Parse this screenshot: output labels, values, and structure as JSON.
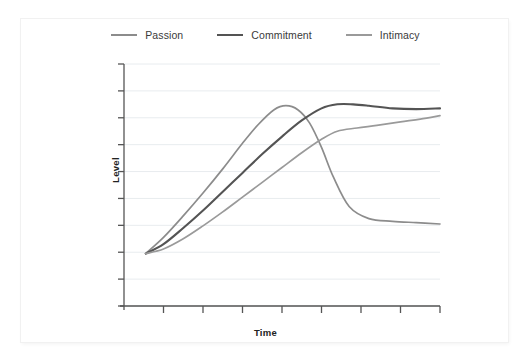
{
  "chart_data": {
    "type": "line",
    "title": "",
    "xlabel": "Time",
    "ylabel": "Level",
    "grid": true,
    "legend_position": "top-center",
    "xlim": [
      0,
      8
    ],
    "ylim": [
      0,
      9
    ],
    "x_tick_count": 8,
    "y_tick_count": 9,
    "x_tick_labels": [],
    "y_tick_labels": [],
    "series": [
      {
        "name": "Passion",
        "color": "#8c8c8c",
        "x": [
          0.55,
          1.0,
          1.5,
          2.0,
          2.5,
          3.0,
          3.4,
          3.8,
          4.1,
          4.4,
          4.7,
          5.0,
          5.3,
          5.7,
          6.2,
          6.8,
          7.4,
          8.0
        ],
        "y": [
          1.95,
          2.55,
          3.35,
          4.2,
          5.1,
          6.05,
          6.75,
          7.3,
          7.45,
          7.3,
          6.8,
          5.9,
          4.8,
          3.7,
          3.25,
          3.15,
          3.1,
          3.05
        ]
      },
      {
        "name": "Commitment",
        "color": "#545454",
        "x": [
          0.55,
          1.0,
          1.5,
          2.0,
          2.5,
          3.0,
          3.5,
          4.0,
          4.5,
          5.0,
          5.4,
          5.8,
          6.2,
          6.8,
          7.4,
          8.0
        ],
        "y": [
          1.95,
          2.3,
          2.9,
          3.55,
          4.25,
          4.95,
          5.65,
          6.3,
          6.9,
          7.35,
          7.5,
          7.5,
          7.45,
          7.35,
          7.32,
          7.35
        ]
      },
      {
        "name": "Intimacy",
        "color": "#9a9a9a",
        "x": [
          0.55,
          1.0,
          1.5,
          2.0,
          2.5,
          3.0,
          3.5,
          4.0,
          4.5,
          5.0,
          5.4,
          5.9,
          6.4,
          7.0,
          7.5,
          8.0
        ],
        "y": [
          1.95,
          2.12,
          2.5,
          2.98,
          3.5,
          4.05,
          4.6,
          5.15,
          5.7,
          6.2,
          6.5,
          6.62,
          6.72,
          6.85,
          6.95,
          7.08
        ]
      }
    ]
  },
  "legend": {
    "items": [
      {
        "label": "Passion",
        "color": "#8c8c8c"
      },
      {
        "label": "Commitment",
        "color": "#545454"
      },
      {
        "label": "Intimacy",
        "color": "#9a9a9a"
      }
    ]
  },
  "axes": {
    "x_title": "Time",
    "y_title": "Level",
    "axis_color": "#555555",
    "grid_color": "#e8ecef"
  }
}
